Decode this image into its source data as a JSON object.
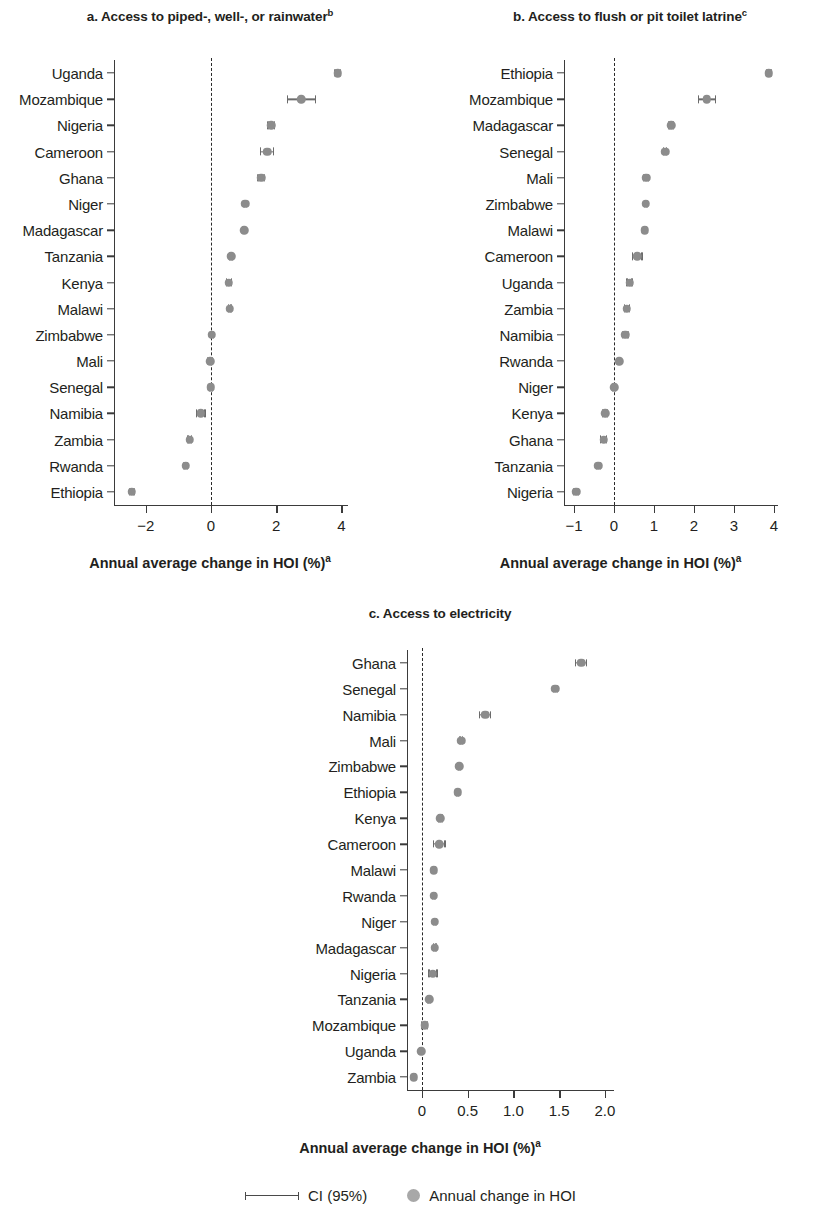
{
  "figure": {
    "legend": {
      "ci_label": "CI (95%)",
      "dot_label": "Annual change in HOI"
    },
    "colors": {
      "dot": "#8c8c8c",
      "ci": "#6b6b6b",
      "axis": "#3b3b3b",
      "text": "#231f20"
    }
  },
  "chart_data": [
    {
      "type": "scatter",
      "panel": "a",
      "title": "a. Access to piped-, well-, or rainwater",
      "title_sup": "b",
      "xlabel": "Annual average change in HOI (%)",
      "xlabel_sup": "a",
      "ylabel": "",
      "xlim": [
        -2.85,
        4.2
      ],
      "xticks": [
        -2,
        0,
        2,
        4
      ],
      "xticklabels": [
        "−2",
        "0",
        "2",
        "4"
      ],
      "grid": false,
      "reference_line": 0,
      "categories": [
        "Uganda",
        "Mozambique",
        "Nigeria",
        "Cameroon",
        "Ghana",
        "Niger",
        "Madagascar",
        "Tanzania",
        "Kenya",
        "Malawi",
        "Zimbabwe",
        "Mali",
        "Senegal",
        "Namibia",
        "Zambia",
        "Rwanda",
        "Ethiopia"
      ],
      "values": [
        3.88,
        2.77,
        1.85,
        1.72,
        1.54,
        1.05,
        1.02,
        0.62,
        0.55,
        0.57,
        0.03,
        -0.03,
        0.0,
        -0.31,
        -0.65,
        -0.77,
        -2.43
      ],
      "ci_low": [
        3.78,
        2.33,
        1.73,
        1.5,
        1.42,
        0.99,
        0.96,
        0.55,
        0.45,
        0.51,
        -0.04,
        -0.13,
        -0.06,
        -0.46,
        -0.72,
        -0.85,
        -2.52
      ],
      "ci_high": [
        3.98,
        3.22,
        1.97,
        1.93,
        1.66,
        1.11,
        1.08,
        0.69,
        0.65,
        0.63,
        0.1,
        0.07,
        0.06,
        -0.16,
        -0.58,
        -0.69,
        -2.34
      ]
    },
    {
      "type": "scatter",
      "panel": "b",
      "title": "b. Access to flush or pit toilet latrine",
      "title_sup": "c",
      "xlabel": "Annual average change in HOI (%)",
      "xlabel_sup": "a",
      "ylabel": "",
      "xlim": [
        -1.15,
        4.1
      ],
      "xticks": [
        -1,
        0,
        1,
        2,
        3,
        4
      ],
      "xticklabels": [
        "−1",
        "0",
        "1",
        "2",
        "3",
        "4"
      ],
      "grid": false,
      "reference_line": 0,
      "categories": [
        "Ethiopia",
        "Mozambique",
        "Madagascar",
        "Senegal",
        "Mali",
        "Zimbabwe",
        "Malawi",
        "Cameroon",
        "Uganda",
        "Zambia",
        "Namibia",
        "Rwanda",
        "Niger",
        "Kenya",
        "Ghana",
        "Tanzania",
        "Nigeria"
      ],
      "values": [
        3.87,
        2.32,
        1.43,
        1.28,
        0.8,
        0.79,
        0.77,
        0.58,
        0.39,
        0.32,
        0.28,
        0.13,
        0.0,
        -0.22,
        -0.26,
        -0.39,
        -0.95
      ],
      "ci_low": [
        3.8,
        2.09,
        1.36,
        1.23,
        0.72,
        0.74,
        0.72,
        0.44,
        0.31,
        0.24,
        0.19,
        0.09,
        -0.05,
        -0.3,
        -0.35,
        -0.46,
        -1.03
      ],
      "ci_high": [
        3.94,
        2.55,
        1.5,
        1.33,
        0.88,
        0.84,
        0.82,
        0.72,
        0.47,
        0.4,
        0.37,
        0.17,
        0.05,
        -0.14,
        -0.17,
        -0.32,
        -0.87
      ]
    },
    {
      "type": "scatter",
      "panel": "c",
      "title": "c. Access to electricity",
      "title_sup": "",
      "xlabel": "Annual average change in HOI (%)",
      "xlabel_sup": "a",
      "ylabel": "",
      "xlim": [
        -0.12,
        2.1
      ],
      "xticks": [
        0,
        0.5,
        1.0,
        1.5,
        2.0
      ],
      "xticklabels": [
        "0",
        "0.5",
        "1.0",
        "1.5",
        "2.0"
      ],
      "grid": false,
      "reference_line": 0,
      "categories": [
        "Ghana",
        "Senegal",
        "Namibia",
        "Mali",
        "Zimbabwe",
        "Ethiopia",
        "Kenya",
        "Cameroon",
        "Malawi",
        "Rwanda",
        "Niger",
        "Madagascar",
        "Nigeria",
        "Tanzania",
        "Mozambique",
        "Uganda",
        "Zambia"
      ],
      "values": [
        1.74,
        1.46,
        0.69,
        0.43,
        0.41,
        0.39,
        0.2,
        0.19,
        0.13,
        0.13,
        0.14,
        0.14,
        0.12,
        0.08,
        0.03,
        -0.01,
        -0.09
      ],
      "ci_low": [
        1.67,
        1.43,
        0.62,
        0.41,
        0.39,
        0.37,
        0.17,
        0.12,
        0.11,
        0.11,
        0.12,
        0.12,
        0.07,
        0.06,
        -0.01,
        -0.03,
        -0.11
      ],
      "ci_high": [
        1.81,
        1.49,
        0.76,
        0.45,
        0.43,
        0.41,
        0.23,
        0.26,
        0.15,
        0.15,
        0.16,
        0.16,
        0.17,
        0.1,
        0.07,
        0.01,
        -0.07
      ]
    }
  ]
}
